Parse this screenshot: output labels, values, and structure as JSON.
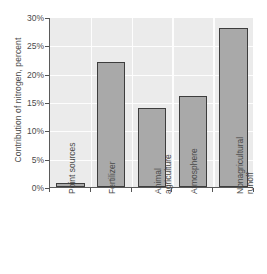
{
  "chart_data": {
    "type": "bar",
    "title": "",
    "subtitle": "",
    "xlabel": "",
    "ylabel": "Contribution of nitrogen, percent",
    "categories": [
      "Point sources",
      "Fertilizer",
      "Animal agriculture",
      "Atmosphere",
      "Nonagricultural runoff"
    ],
    "category_lines": [
      [
        "Point sources"
      ],
      [
        "Fertilizer"
      ],
      [
        "Animal",
        "agriculture"
      ],
      [
        "Atmosphere"
      ],
      [
        "Nonagricultural",
        "runoff"
      ]
    ],
    "values": [
      0.7,
      22,
      14,
      16,
      28
    ],
    "ylim": [
      0,
      30
    ],
    "ytick_values": [
      0,
      5,
      10,
      15,
      20,
      25,
      30
    ],
    "ytick_labels": [
      "0%",
      "5%",
      "10%",
      "15%",
      "20%",
      "25%",
      "30%"
    ],
    "grid": "horizontal-and-vertical",
    "legend": "none",
    "bar_color": "#a9a9a9",
    "bar_border_color": "#3d3d3d",
    "plot_background": "#ebebeb",
    "gridline_color": "#fdfdfd",
    "axis_color": "#5a5a5a"
  }
}
